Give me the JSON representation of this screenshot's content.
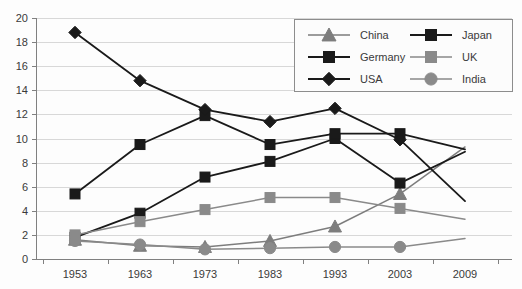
{
  "chart_data": {
    "type": "line",
    "title": "",
    "xlabel": "",
    "ylabel": "",
    "x": [
      "1953",
      "1963",
      "1973",
      "1983",
      "1993",
      "2003",
      "2009"
    ],
    "categories": [
      "1953",
      "1963",
      "1973",
      "1983",
      "1993",
      "2003",
      "2009"
    ],
    "ylim": [
      0,
      20
    ],
    "ytick_step": 2,
    "yticks": [
      "0",
      "2",
      "4",
      "6",
      "8",
      "10",
      "12",
      "14",
      "16",
      "18",
      "20"
    ],
    "grid": true,
    "legend_position": "top-right",
    "series": [
      {
        "name": "China",
        "color": "#7d7d7d",
        "marker": "triangle",
        "values": [
          1.6,
          1.1,
          1.0,
          1.5,
          2.7,
          5.4,
          9.3
        ]
      },
      {
        "name": "Japan",
        "color": "#1a1a1a",
        "marker": "square",
        "values": [
          1.8,
          3.8,
          6.8,
          8.1,
          10.0,
          6.3,
          8.9
        ]
      },
      {
        "name": "Germany",
        "color": "#1a1a1a",
        "marker": "square",
        "values": [
          5.4,
          9.5,
          11.9,
          9.5,
          10.4,
          10.4,
          9.1
        ]
      },
      {
        "name": "UK",
        "color": "#8a8a8a",
        "marker": "square",
        "values": [
          2.0,
          3.1,
          4.1,
          5.1,
          5.1,
          4.2,
          3.3
        ]
      },
      {
        "name": "USA",
        "color": "#1a1a1a",
        "marker": "diamond",
        "values": [
          18.8,
          14.8,
          12.4,
          11.4,
          12.5,
          9.9,
          4.8
        ]
      },
      {
        "name": "India",
        "color": "#8a8a8a",
        "marker": "circle",
        "values": [
          1.5,
          1.2,
          0.8,
          0.9,
          1.0,
          1.0,
          1.7
        ]
      }
    ]
  },
  "legend": {
    "entries": [
      {
        "label": "China",
        "marker": "triangle-icon",
        "color": "#7d7d7d"
      },
      {
        "label": "Japan",
        "marker": "square-icon",
        "color": "#1a1a1a"
      },
      {
        "label": "Germany",
        "marker": "square-icon",
        "color": "#1a1a1a"
      },
      {
        "label": "UK",
        "marker": "square-icon",
        "color": "#8a8a8a"
      },
      {
        "label": "USA",
        "marker": "diamond-icon",
        "color": "#1a1a1a"
      },
      {
        "label": "India",
        "marker": "circle-icon",
        "color": "#8a8a8a"
      }
    ]
  },
  "colors": {
    "black_series": "#1a1a1a",
    "gray_series": "#8a8a8a",
    "china_gray": "#7d7d7d",
    "gridline": "#d8d8d8",
    "axis": "#808080",
    "text": "#3a3a3a",
    "background": "#fdfdfd"
  }
}
